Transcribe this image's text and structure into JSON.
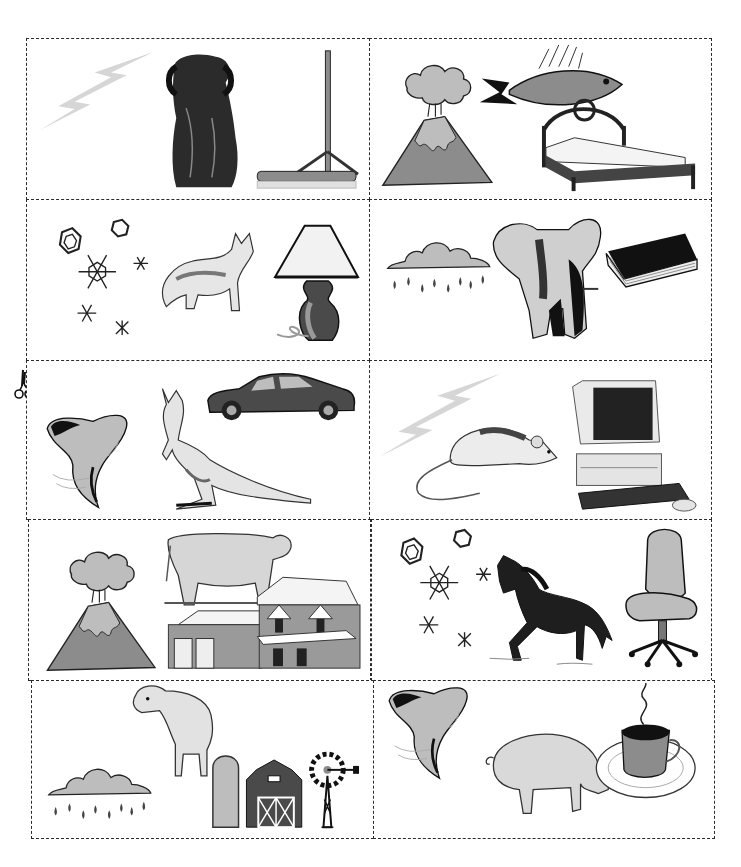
{
  "sheet": {
    "title": "Picture cards: weather, animal, object",
    "cut_mark": "scissors-icon",
    "colors": {
      "line": "#2a2a2a",
      "light_gray": "#bdbdbd",
      "mid_gray": "#8c8c8c",
      "dark_gray": "#4a4a4a",
      "black": "#111111"
    }
  },
  "cards": [
    {
      "row": 1,
      "col": 1,
      "items": [
        "lightning",
        "dog",
        "broom"
      ]
    },
    {
      "row": 1,
      "col": 2,
      "items": [
        "volcano",
        "fish",
        "bed"
      ]
    },
    {
      "row": 2,
      "col": 1,
      "items": [
        "snowflakes",
        "cat",
        "lamp"
      ]
    },
    {
      "row": 2,
      "col": 2,
      "items": [
        "rain cloud",
        "elephant",
        "book"
      ]
    },
    {
      "row": 3,
      "col": 1,
      "items": [
        "tornado",
        "kangaroo",
        "car"
      ]
    },
    {
      "row": 3,
      "col": 2,
      "items": [
        "lightning",
        "mouse",
        "computer"
      ]
    },
    {
      "row": 4,
      "col": 1,
      "items": [
        "volcano",
        "cow",
        "house"
      ]
    },
    {
      "row": 4,
      "col": 2,
      "items": [
        "snowflakes",
        "horse",
        "office chair"
      ]
    },
    {
      "row": 5,
      "col": 1,
      "items": [
        "rain cloud",
        "sheep",
        "farm barn"
      ]
    },
    {
      "row": 5,
      "col": 2,
      "items": [
        "tornado",
        "pig",
        "coffee cup"
      ]
    }
  ]
}
